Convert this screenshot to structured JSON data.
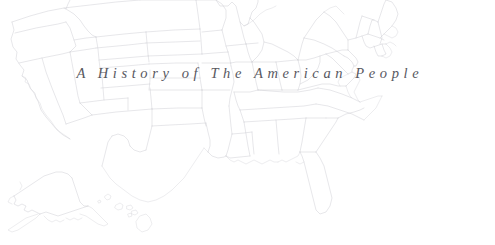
{
  "page": {
    "background_color": "#ffffff",
    "width": 495,
    "height": 245
  },
  "title_overlay": {
    "text": "A History of The American People",
    "color": "#4a4a52",
    "style": "italic-serif-letterspaced"
  },
  "map": {
    "name": "united-states-outline-map",
    "description": "Faint light-gray outline map of the United States showing state boundaries for the contiguous 48 states plus Alaska and Hawaii",
    "line_color": "#c9c9cf",
    "fill_color": "#ffffff",
    "regions": [
      {
        "id": "contiguous",
        "label": "Contiguous United States"
      },
      {
        "id": "alaska",
        "label": "Alaska"
      },
      {
        "id": "hawaii",
        "label": "Hawaii"
      }
    ],
    "states": [
      "Washington",
      "Oregon",
      "California",
      "Nevada",
      "Idaho",
      "Montana",
      "Wyoming",
      "Utah",
      "Arizona",
      "Colorado",
      "New Mexico",
      "North Dakota",
      "South Dakota",
      "Nebraska",
      "Kansas",
      "Oklahoma",
      "Texas",
      "Minnesota",
      "Iowa",
      "Missouri",
      "Arkansas",
      "Louisiana",
      "Wisconsin",
      "Illinois",
      "Michigan",
      "Indiana",
      "Ohio",
      "Kentucky",
      "Tennessee",
      "Mississippi",
      "Alabama",
      "Georgia",
      "Florida",
      "South Carolina",
      "North Carolina",
      "Virginia",
      "West Virginia",
      "Maryland",
      "Delaware",
      "Pennsylvania",
      "New Jersey",
      "New York",
      "Connecticut",
      "Rhode Island",
      "Massachusetts",
      "Vermont",
      "New Hampshire",
      "Maine",
      "Alaska",
      "Hawaii"
    ]
  }
}
